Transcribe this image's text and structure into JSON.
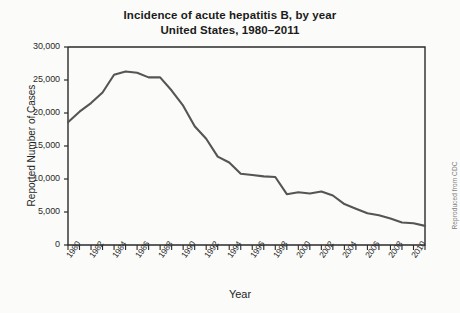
{
  "chart_data": {
    "type": "line",
    "title": "Incidence of acute hepatitis B, by year",
    "subtitle": "United States, 1980–2011",
    "xlabel": "Year",
    "ylabel": "Reported Number of Cases",
    "ylim": [
      0,
      30000
    ],
    "xlim": [
      1980,
      2011
    ],
    "grid": false,
    "legend": null,
    "ytick_labels": [
      "30,000",
      "25,000",
      "20,000",
      "15,000",
      "10,000",
      "5,000",
      "0"
    ],
    "ytick_values": [
      30000,
      25000,
      20000,
      15000,
      10000,
      5000,
      0
    ],
    "xtick_labels": [
      "1980",
      "1982",
      "1984",
      "1986",
      "1988",
      "1990",
      "1992",
      "1994",
      "1996",
      "1998",
      "2000",
      "2002",
      "2004",
      "2006",
      "2008",
      "2010"
    ],
    "xtick_values": [
      1980,
      1982,
      1984,
      1986,
      1988,
      1990,
      1992,
      1994,
      1996,
      1998,
      2000,
      2002,
      2004,
      2006,
      2008,
      2010
    ],
    "minor_tick_interval_years": 1,
    "x": [
      1980,
      1981,
      1982,
      1983,
      1984,
      1985,
      1986,
      1987,
      1988,
      1989,
      1990,
      1991,
      1992,
      1993,
      1994,
      1995,
      1996,
      1997,
      1998,
      1999,
      2000,
      2001,
      2002,
      2003,
      2004,
      2005,
      2006,
      2007,
      2008,
      2009,
      2010,
      2011
    ],
    "series": [
      {
        "name": "Reported cases of acute hepatitis B",
        "color": "#555555",
        "values": [
          18600,
          20200,
          21500,
          23100,
          25800,
          26300,
          26100,
          25400,
          25400,
          23400,
          21100,
          18000,
          16100,
          13400,
          12500,
          10800,
          10600,
          10400,
          10300,
          7700,
          8000,
          7800,
          8100,
          7500,
          6200,
          5500,
          4800,
          4500,
          4000,
          3400,
          3300,
          2900
        ]
      }
    ]
  },
  "credit": {
    "text": "Reproduced from CDC"
  }
}
